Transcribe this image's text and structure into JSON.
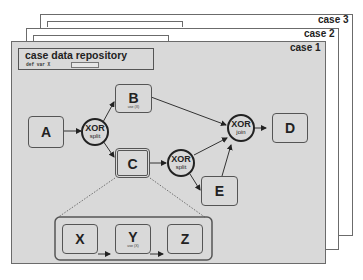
{
  "cases": [
    {
      "label": "case 3"
    },
    {
      "label": "case 2"
    },
    {
      "label": "case 1"
    }
  ],
  "repository": {
    "title": "case data repository",
    "var_label": "def var X"
  },
  "tasks": {
    "A": {
      "label": "A"
    },
    "B": {
      "label": "B",
      "sub": "use (X)"
    },
    "C": {
      "label": "C"
    },
    "D": {
      "label": "D"
    },
    "E": {
      "label": "E"
    },
    "X": {
      "label": "X"
    },
    "Y": {
      "label": "Y",
      "sub": "use (X)"
    },
    "Z": {
      "label": "Z"
    }
  },
  "gateways": {
    "split1": {
      "type": "XOR",
      "kind": "split"
    },
    "split2": {
      "type": "XOR",
      "kind": "split"
    },
    "join": {
      "type": "XOR",
      "kind": "join"
    }
  },
  "colors": {
    "sheet_fill": "#d9d9d9",
    "border": "#555555",
    "background": "#ffffff"
  }
}
